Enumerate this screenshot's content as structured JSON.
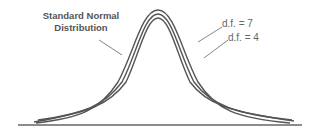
{
  "figure": {
    "title_line1": "Standard Normal",
    "title_line2": "Distribution",
    "label_df7": "d.f.  = 7",
    "label_df4": "d.f.  = 4",
    "stroke_color": "#555555",
    "text_color": "#666666"
  },
  "curves": [
    {
      "name": "standard-normal",
      "label": "Standard Normal Distribution",
      "peak_y": 10
    },
    {
      "name": "t-df-7",
      "label": "d.f. = 7",
      "peak_y": 14
    },
    {
      "name": "t-df-4",
      "label": "d.f. = 4",
      "peak_y": 18
    }
  ]
}
